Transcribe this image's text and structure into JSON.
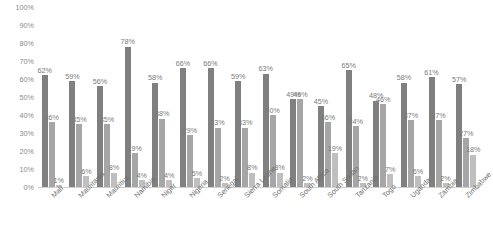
{
  "chart_data": {
    "type": "bar",
    "title": "",
    "subtitle": "",
    "xlabel": "",
    "ylabel": "",
    "ylim": [
      0,
      100
    ],
    "y_ticks": [
      "0%",
      "10%",
      "20%",
      "30%",
      "40%",
      "50%",
      "60%",
      "70%",
      "80%",
      "90%",
      "100%"
    ],
    "grid": false,
    "legend": "none",
    "value_suffix": "%",
    "categories": [
      "Mali",
      "Mauritania",
      "Mauritius",
      "Namibia",
      "Niger",
      "Nigeria",
      "Senegal",
      "Sierra Leone",
      "Somalia",
      "South Africa",
      "South Sudan",
      "Tanzania",
      "Togo",
      "Uganda",
      "Zambia",
      "Zimbabwe"
    ],
    "series": [
      {
        "name": "Series 1",
        "color": "#808080",
        "values": [
          62,
          59,
          56,
          78,
          58,
          66,
          66,
          59,
          63,
          49,
          45,
          65,
          48,
          58,
          61,
          57
        ]
      },
      {
        "name": "Series 2",
        "color": "#a6a6a6",
        "values": [
          36,
          35,
          35,
          19,
          38,
          29,
          33,
          33,
          40,
          49,
          36,
          34,
          46,
          37,
          37,
          27
        ]
      },
      {
        "name": "Series 3",
        "color": "#bfbfbf",
        "values": [
          1,
          6,
          8,
          4,
          4,
          5,
          2,
          8,
          8,
          2,
          19,
          2,
          7,
          6,
          2,
          18
        ]
      }
    ],
    "bar_labels": [
      [
        "62%",
        "36%",
        "1%"
      ],
      [
        "59%",
        "35%",
        "6%"
      ],
      [
        "56%",
        "35%",
        "8%"
      ],
      [
        "78%",
        "19%",
        "4%"
      ],
      [
        "58%",
        "38%",
        "4%"
      ],
      [
        "66%",
        "29%",
        "5%"
      ],
      [
        "66%",
        "33%",
        "2%"
      ],
      [
        "59%",
        "33%",
        "8%"
      ],
      [
        "63%",
        "40%",
        "8%"
      ],
      [
        "49%",
        "49%",
        "2%"
      ],
      [
        "45%",
        "36%",
        "19%"
      ],
      [
        "65%",
        "34%",
        "2%"
      ],
      [
        "48%",
        "46%",
        "7%"
      ],
      [
        "58%",
        "37%",
        "6%"
      ],
      [
        "61%",
        "37%",
        "2%"
      ],
      [
        "57%",
        "27%",
        "18%"
      ]
    ]
  }
}
